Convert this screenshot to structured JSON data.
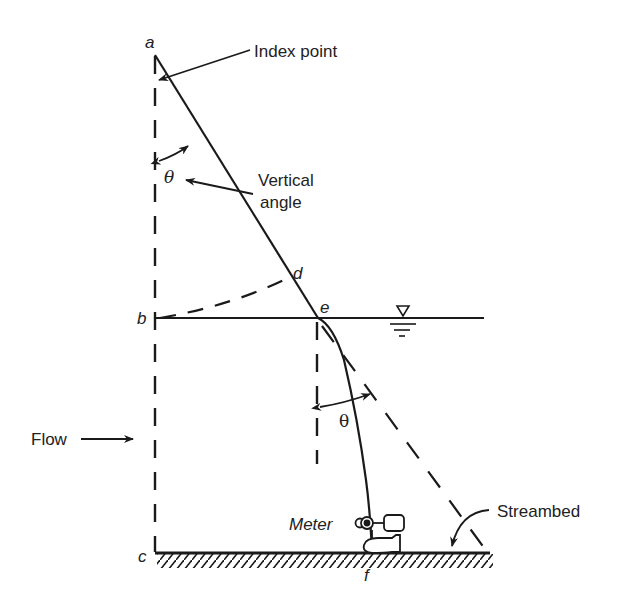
{
  "labels": {
    "a": "a",
    "b": "b",
    "c": "c",
    "d": "d",
    "e": "e",
    "f": "f",
    "theta_upper": "θ",
    "theta_lower": "θ",
    "index_point": "Index point",
    "vertical_angle_line1": "Vertical",
    "vertical_angle_line2": "angle",
    "flow": "Flow",
    "meter": "Meter",
    "streambed": "Streambed"
  },
  "colors": {
    "line": "#1a1a1a",
    "text": "#222222",
    "background": "#ffffff"
  }
}
